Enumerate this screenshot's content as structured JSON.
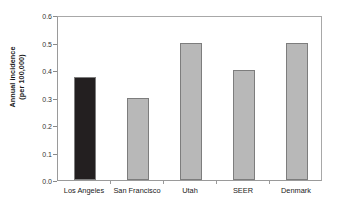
{
  "chart_data": {
    "type": "bar",
    "title": "",
    "subtitle": "",
    "xlabel": "",
    "ylabel": "Annual incidence (per 100,000)",
    "ylabel_lines": [
      "Annual incidence",
      "(per 100,000)"
    ],
    "categories": [
      "Los Angeles",
      "San Francisco",
      "Utah",
      "SEER",
      "Denmark"
    ],
    "values": [
      0.375,
      0.3,
      0.5,
      0.4,
      0.5
    ],
    "series": [
      {
        "name": "Annual incidence (per 100,000)",
        "values": [
          0.375,
          0.3,
          0.5,
          0.4,
          0.5
        ]
      }
    ],
    "bar_colors": [
      "#231f20",
      "#b8b8b8",
      "#b8b8b8",
      "#b8b8b8",
      "#b8b8b8"
    ],
    "highlight_category": "Los Angeles",
    "highlight_color": "#231f20",
    "default_bar_color": "#b8b8b8",
    "bar_border_color": "#7d7d7d",
    "ylim": [
      0.0,
      0.6
    ],
    "ytick_values": [
      0.0,
      0.1,
      0.2,
      0.3,
      0.4,
      0.5,
      0.6
    ],
    "ytick_labels": [
      "0.0",
      "0.1",
      "0.2",
      "0.3",
      "0.4",
      "0.5",
      "0.6"
    ],
    "grid": false,
    "legend": false,
    "legend_position": "none",
    "frame": true,
    "annotations": []
  }
}
